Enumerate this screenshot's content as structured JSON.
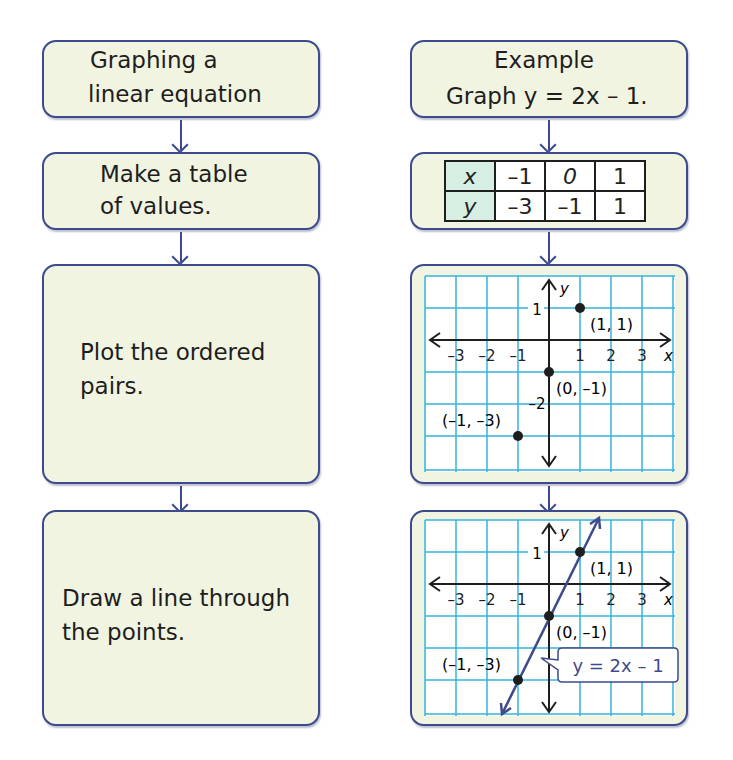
{
  "left_column": {
    "steps": [
      {
        "line1": "Graphing a",
        "line2": "linear equation"
      },
      {
        "line1": "Make a table",
        "line2": "of values."
      },
      {
        "line1": "Plot the ordered",
        "line2": "pairs."
      },
      {
        "line1": "Draw a line through",
        "line2": "the points."
      }
    ]
  },
  "right_column": {
    "example_title": "Example",
    "example_task": "Graph y = 2x – 1.",
    "table": {
      "rows": [
        {
          "header": "x",
          "values": [
            "–1",
            "0",
            "1"
          ]
        },
        {
          "header": "y",
          "values": [
            "–3",
            "–1",
            "1"
          ]
        }
      ]
    },
    "graph1": {
      "axis_x_label": "x",
      "axis_y_label": "y",
      "x_ticks": [
        "–3",
        "–2",
        "–1",
        "1",
        "2",
        "3"
      ],
      "y_tick_1": "1",
      "y_tick_neg2": "–2",
      "point_labels": [
        "(1, 1)",
        "(0, –1)",
        "(–1, –3)"
      ]
    },
    "graph2": {
      "axis_x_label": "x",
      "axis_y_label": "y",
      "x_ticks": [
        "–3",
        "–2",
        "–1",
        "1",
        "2",
        "3"
      ],
      "y_tick_1": "1",
      "point_labels": [
        "(1, 1)",
        "(0, –1)",
        "(–1, –3)"
      ],
      "line_label": "y = 2x – 1"
    }
  },
  "colors": {
    "box_border": "#3d4a8c",
    "box_fill": "#f2f4e2",
    "grid": "#35b3dc",
    "table_header": "#d7eee3"
  }
}
